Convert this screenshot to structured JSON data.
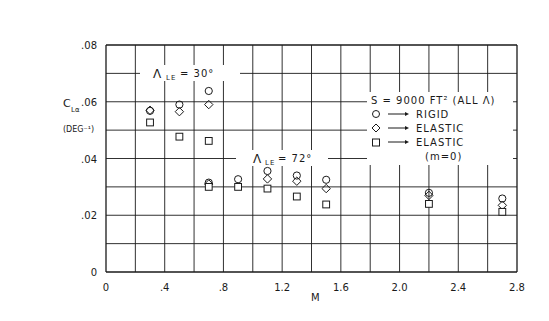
{
  "chart_data": {
    "type": "scatter",
    "title": "",
    "xlabel": "M",
    "ylabel": "C_Lα (DEG⁻¹)",
    "ylabel_line1": "C",
    "ylabel_sub": "Lα",
    "ylabel_line2": "(DEG⁻¹)",
    "xlim": [
      0,
      2.8
    ],
    "ylim": [
      0,
      0.08
    ],
    "grid": true,
    "x_ticks": [
      0,
      0.4,
      0.8,
      1.2,
      1.6,
      2.0,
      2.4,
      2.8
    ],
    "x_tick_labels": [
      "0",
      ".4",
      ".8",
      "1.2",
      "1.6",
      "2.0",
      "2.4",
      "2.8"
    ],
    "y_ticks": [
      0,
      0.02,
      0.04,
      0.06,
      0.08
    ],
    "y_tick_labels": [
      "0",
      ".02",
      ".04",
      ".06",
      ".08"
    ],
    "annotations": [
      {
        "text": "Λ LE = 30°",
        "main": "Λ",
        "sub": "LE",
        "rest": " = 30°",
        "x": 0.5,
        "y": 0.07
      },
      {
        "text": "Λ LE = 72°",
        "main": "Λ",
        "sub": "LE",
        "rest": " = 72°",
        "x": 1.35,
        "y": 0.04
      }
    ],
    "legend": {
      "position": "right-middle",
      "title": "S = 9000 FT² (ALL Λ)",
      "entries": [
        {
          "marker": "circle",
          "label": "RIGID"
        },
        {
          "marker": "diamond",
          "label": "ELASTIC"
        },
        {
          "marker": "square",
          "label": "ELASTIC",
          "label2": "(m=0)"
        }
      ]
    },
    "series": [
      {
        "name": "Rigid",
        "marker": "circle",
        "points": [
          {
            "x": 0.3,
            "y": 0.0568,
            "sweep": "30"
          },
          {
            "x": 0.5,
            "y": 0.059,
            "sweep": "30"
          },
          {
            "x": 0.7,
            "y": 0.0638,
            "sweep": "30"
          },
          {
            "x": 0.7,
            "y": 0.0315,
            "sweep": "72"
          },
          {
            "x": 0.9,
            "y": 0.0327,
            "sweep": "72"
          },
          {
            "x": 1.1,
            "y": 0.0356,
            "sweep": "72"
          },
          {
            "x": 1.3,
            "y": 0.034,
            "sweep": "72"
          },
          {
            "x": 1.5,
            "y": 0.0325,
            "sweep": "72"
          },
          {
            "x": 2.2,
            "y": 0.0279,
            "sweep": "72"
          },
          {
            "x": 2.7,
            "y": 0.0259,
            "sweep": "72"
          }
        ]
      },
      {
        "name": "Elastic",
        "marker": "diamond",
        "points": [
          {
            "x": 0.3,
            "y": 0.057,
            "sweep": "30"
          },
          {
            "x": 0.5,
            "y": 0.0565,
            "sweep": "30"
          },
          {
            "x": 0.7,
            "y": 0.059,
            "sweep": "30"
          },
          {
            "x": 0.7,
            "y": 0.031,
            "sweep": "72"
          },
          {
            "x": 1.1,
            "y": 0.0328,
            "sweep": "72"
          },
          {
            "x": 1.3,
            "y": 0.032,
            "sweep": "72"
          },
          {
            "x": 1.5,
            "y": 0.0294,
            "sweep": "72"
          },
          {
            "x": 2.2,
            "y": 0.027,
            "sweep": "72"
          },
          {
            "x": 2.7,
            "y": 0.0235,
            "sweep": "72"
          }
        ]
      },
      {
        "name": "Elastic (m=0)",
        "marker": "square",
        "points": [
          {
            "x": 0.3,
            "y": 0.0527,
            "sweep": "30"
          },
          {
            "x": 0.5,
            "y": 0.0477,
            "sweep": "30"
          },
          {
            "x": 0.7,
            "y": 0.0462,
            "sweep": "30"
          },
          {
            "x": 0.7,
            "y": 0.03,
            "sweep": "72"
          },
          {
            "x": 0.9,
            "y": 0.03,
            "sweep": "72"
          },
          {
            "x": 1.1,
            "y": 0.0294,
            "sweep": "72"
          },
          {
            "x": 1.3,
            "y": 0.0266,
            "sweep": "72"
          },
          {
            "x": 1.5,
            "y": 0.0238,
            "sweep": "72"
          },
          {
            "x": 2.2,
            "y": 0.024,
            "sweep": "72"
          },
          {
            "x": 2.7,
            "y": 0.0212,
            "sweep": "72"
          }
        ]
      }
    ]
  },
  "colors": {
    "ink": "#1a1a1a",
    "background": "#ffffff"
  }
}
